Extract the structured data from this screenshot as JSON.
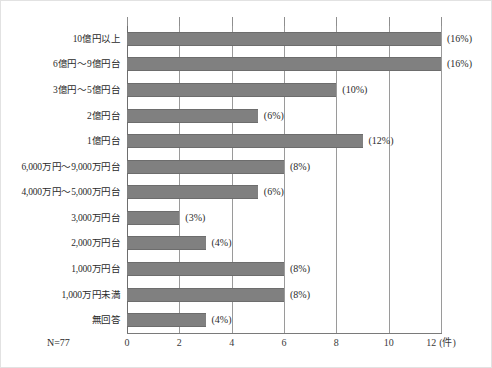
{
  "chart_data": {
    "type": "bar",
    "orientation": "horizontal",
    "title": "",
    "xlabel": "(件)",
    "ylabel": "",
    "xlim": [
      0,
      12
    ],
    "xticks": [
      0,
      2,
      4,
      6,
      8,
      10,
      12
    ],
    "xtick_labels": [
      "0",
      "2",
      "4",
      "6",
      "8",
      "10",
      "12"
    ],
    "unit_label": "(件)",
    "grid": true,
    "grid_axis": "x",
    "legend": "none",
    "sample_size_label": "N=77",
    "bar_color": "#808080",
    "categories": [
      "10億円以上",
      "6億円～9億円台",
      "3億円～5億円台",
      "2億円台",
      "1億円台",
      "6,000万円～9,000万円台",
      "4,000万円～5,000万円台",
      "3,000万円台",
      "2,000万円台",
      "1,000万円台",
      "1,000万円未満",
      "無回答"
    ],
    "values": [
      12,
      12,
      8,
      5,
      9,
      6,
      5,
      2,
      3,
      6,
      6,
      3
    ],
    "data_labels": [
      "(16%)",
      "(16%)",
      "(10%)",
      "(6%)",
      "(12%)",
      "(8%)",
      "(6%)",
      "(3%)",
      "(4%)",
      "(8%)",
      "(8%)",
      "(4%)"
    ],
    "percentages": [
      16,
      16,
      10,
      6,
      12,
      8,
      6,
      3,
      4,
      8,
      8,
      4
    ]
  }
}
